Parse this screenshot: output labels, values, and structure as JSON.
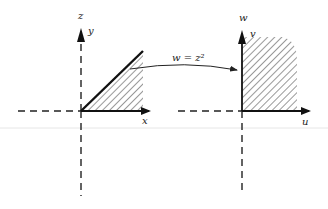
{
  "diagram": {
    "mapping_label": "w = z²",
    "left_plane": {
      "plane_label": "z",
      "horizontal_axis": "x",
      "vertical_axis": "y",
      "region": "wedge between positive x-axis and line at 45°, hatched"
    },
    "right_plane": {
      "plane_label": "w",
      "horizontal_axis": "u",
      "vertical_axis": "v",
      "region": "first quadrant, hatched"
    },
    "colors": {
      "ink": "#222222",
      "background": "#ffffff",
      "faint_rule": "#e6e6e6"
    }
  }
}
